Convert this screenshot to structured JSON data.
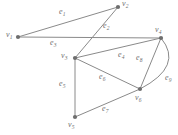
{
  "figure": {
    "type": "undirected-graph-diagram",
    "width": 178,
    "height": 135,
    "background_color": "#ffffff",
    "line_color": "#8a8a8a",
    "vertex_color": "#6e6e6e",
    "label_color": "#707070"
  },
  "vertices": [
    {
      "id": "v1",
      "base": "v",
      "sub": "1",
      "x": 18,
      "y": 37,
      "label_x": 6,
      "label_y": 31
    },
    {
      "id": "v2",
      "base": "v",
      "sub": "2",
      "x": 118,
      "y": 7,
      "label_x": 122,
      "label_y": 0
    },
    {
      "id": "v3",
      "base": "v",
      "sub": "3",
      "x": 75,
      "y": 58,
      "label_x": 61,
      "label_y": 52
    },
    {
      "id": "v4",
      "base": "v",
      "sub": "4",
      "x": 161,
      "y": 38,
      "label_x": 155,
      "label_y": 26
    },
    {
      "id": "v5",
      "base": "v",
      "sub": "5",
      "x": 75,
      "y": 117,
      "label_x": 68,
      "label_y": 121
    },
    {
      "id": "v6",
      "base": "v",
      "sub": "6",
      "x": 140,
      "y": 89,
      "label_x": 135,
      "label_y": 94
    }
  ],
  "edges": [
    {
      "id": "e1",
      "base": "e",
      "sub": "1",
      "from": "v1",
      "to": "v2",
      "shape": "line",
      "label_x": 59,
      "label_y": 8
    },
    {
      "id": "e2",
      "base": "e",
      "sub": "2",
      "from": "v2",
      "to": "v3",
      "shape": "line",
      "label_x": 103,
      "label_y": 22
    },
    {
      "id": "e3",
      "base": "e",
      "sub": "3",
      "from": "v1",
      "to": "v4",
      "shape": "line",
      "label_x": 50,
      "label_y": 39
    },
    {
      "id": "e4",
      "base": "e",
      "sub": "4",
      "from": "v3",
      "to": "v4",
      "shape": "line",
      "label_x": 118,
      "label_y": 51
    },
    {
      "id": "e5",
      "base": "e",
      "sub": "5",
      "from": "v3",
      "to": "v5",
      "shape": "line",
      "label_x": 59,
      "label_y": 80
    },
    {
      "id": "e6",
      "base": "e",
      "sub": "6",
      "from": "v3",
      "to": "v6",
      "shape": "line",
      "label_x": 99,
      "label_y": 73
    },
    {
      "id": "e7",
      "base": "e",
      "sub": "7",
      "from": "v5",
      "to": "v6",
      "shape": "line",
      "label_x": 102,
      "label_y": 105
    },
    {
      "id": "e8",
      "base": "e",
      "sub": "8",
      "from": "v4",
      "to": "v6",
      "shape": "line",
      "label_x": 136,
      "label_y": 54
    },
    {
      "id": "e9",
      "base": "e",
      "sub": "9",
      "from": "v4",
      "to": "v6",
      "shape": "curve",
      "curve_control_x": 184,
      "curve_control_y": 66,
      "label_x": 165,
      "label_y": 74
    }
  ]
}
